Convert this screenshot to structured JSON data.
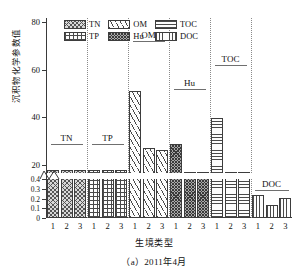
{
  "chart_data": {
    "type": "bar",
    "title": "",
    "caption": "（a）2011年4月",
    "xlabel": "生境类型",
    "ylabel": "沉积物化学参数值",
    "grid": false,
    "legend_position": "top-center",
    "broken_axis": true,
    "upper_axis": {
      "ylim": [
        0,
        80
      ],
      "ticks": [
        0,
        20,
        40,
        60,
        80
      ],
      "tick_labels": [
        "",
        "20",
        "40",
        "60",
        "80"
      ]
    },
    "lower_axis": {
      "ylim": [
        0,
        0.4
      ],
      "ticks": [
        0,
        0.1,
        0.2,
        0.3,
        0.4
      ],
      "tick_labels": [
        "0",
        "0.1",
        "0.2",
        "0.3",
        "0.4"
      ]
    },
    "categories": [
      "1",
      "2",
      "3",
      "1",
      "2",
      "3",
      "1",
      "2",
      "3",
      "1",
      "2",
      "3",
      "1",
      "2",
      "3",
      "1",
      "2",
      "3"
    ],
    "groups": [
      {
        "name": "TN",
        "pattern": "crosshatch-dense",
        "scale": "lower",
        "habitats": [
          "1",
          "2",
          "3"
        ],
        "values": [
          0.45,
          0.45,
          0.45
        ]
      },
      {
        "name": "TP",
        "pattern": "grid",
        "scale": "lower",
        "habitats": [
          "1",
          "2",
          "3"
        ],
        "values": [
          0.46,
          0.45,
          0.44
        ]
      },
      {
        "name": "OM",
        "pattern": "diagonal-stripes",
        "scale": "upper",
        "habitats": [
          "1",
          "2",
          "3"
        ],
        "values": [
          51,
          27,
          26
        ]
      },
      {
        "name": "Hu",
        "pattern": "speckle-dark",
        "scale": "upper",
        "habitats": [
          "1",
          "2",
          "3"
        ],
        "values": [
          28.5,
          15,
          15
        ]
      },
      {
        "name": "TOC",
        "pattern": "horizontal-lines",
        "scale": "upper",
        "habitats": [
          "1",
          "2",
          "3"
        ],
        "values": [
          39.5,
          16.5,
          14
        ]
      },
      {
        "name": "DOC",
        "pattern": "vertical-lines",
        "scale": "lower",
        "habitats": [
          "1",
          "2",
          "3"
        ],
        "values": [
          0.24,
          0.13,
          0.21
        ]
      }
    ],
    "legend": [
      {
        "label": "TN",
        "pattern": "crosshatch-dense"
      },
      {
        "label": "OM",
        "pattern": "diagonal-stripes"
      },
      {
        "label": "TOC",
        "pattern": "horizontal-lines"
      },
      {
        "label": "TP",
        "pattern": "grid"
      },
      {
        "label": "Hu",
        "pattern": "speckle-dark"
      },
      {
        "label": "DOC",
        "pattern": "vertical-lines"
      }
    ]
  }
}
